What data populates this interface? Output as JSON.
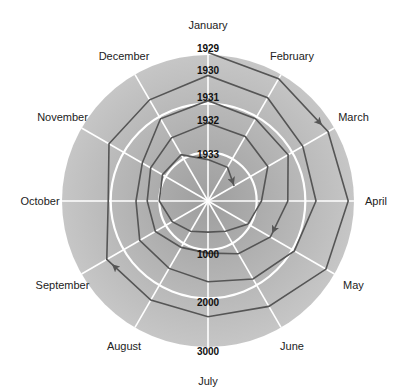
{
  "chart_data": {
    "type": "radial-spiral",
    "title": "",
    "months": [
      "January",
      "February",
      "March",
      "April",
      "May",
      "June",
      "July",
      "August",
      "September",
      "October",
      "November",
      "December"
    ],
    "year_labels": [
      "1929",
      "1930",
      "1931",
      "1932",
      "1933"
    ],
    "value_axis": {
      "ticks": [
        1000,
        2000,
        3000
      ],
      "labels": [
        "1000",
        "2000",
        "3000"
      ],
      "max": 3000
    },
    "series": [
      {
        "name": "1929",
        "values": [
          3050,
          2900,
          2850,
          2880,
          2800,
          2500,
          2380,
          2350,
          2400,
          2050,
          2350,
          2400
        ]
      },
      {
        "name": "1930",
        "values": [
          2580,
          2450,
          2250,
          2220,
          2050,
          1850,
          1660,
          1600,
          1620,
          1480,
          1560,
          1950
        ]
      },
      {
        "name": "1931",
        "values": [
          2060,
          1950,
          1900,
          1640,
          1480,
          1250,
          1070,
          1100,
          1250,
          1250,
          1360,
          1500
        ]
      },
      {
        "name": "1932",
        "values": [
          1600,
          1530,
          1420,
          1100,
          950,
          720,
          640,
          720,
          850,
          1000,
          1080,
          1100
        ]
      },
      {
        "name": "1933",
        "values": [
          850,
          800,
          620
        ]
      }
    ],
    "arrows_at": [
      {
        "year": "1929",
        "month": "March"
      },
      {
        "year": "1929",
        "month": "September"
      },
      {
        "year": "1931",
        "month": "May"
      },
      {
        "year": "1933",
        "month": "March"
      }
    ],
    "grid": true
  },
  "style": {
    "disc_inner": "#a9a9a9",
    "disc_outer": "#c4c4c4",
    "grid_color": "#ffffff",
    "line_color": "#555555"
  }
}
